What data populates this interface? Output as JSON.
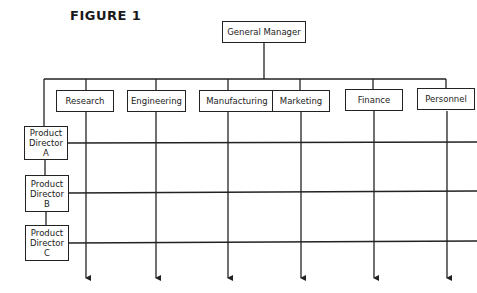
{
  "figure": {
    "title": "FIGURE 1"
  },
  "top": {
    "label": "General Manager"
  },
  "departments": [
    {
      "label": "Research"
    },
    {
      "label": "Engineering"
    },
    {
      "label": "Manufacturing"
    },
    {
      "label": "Marketing"
    },
    {
      "label": "Finance"
    },
    {
      "label": "Personnel"
    }
  ],
  "product_directors": [
    {
      "line1": "Product",
      "line2": "Director",
      "line3": "A"
    },
    {
      "line1": "Product",
      "line2": "Director",
      "line3": "B"
    },
    {
      "line1": "Product",
      "line2": "Director",
      "line3": "C"
    }
  ],
  "colors": {
    "line": "#222222",
    "background": "#ffffff"
  }
}
